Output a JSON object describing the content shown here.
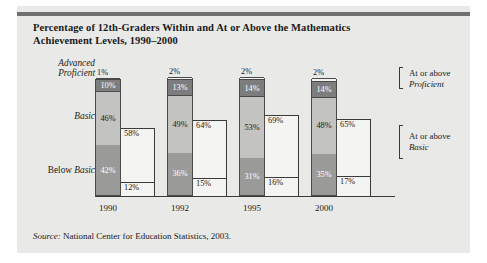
{
  "card": {
    "title_line1": "Percentage of 12th-Graders Within and At or Above the Mathematics",
    "title_line2": "Achievement Levels, 1990–2000",
    "source_prefix": "Source:",
    "source_text": " National Center for Education Statistics, 2003."
  },
  "axis_labels": {
    "left": [
      {
        "line1": "Advanced",
        "line2": "Proficient"
      },
      {
        "line1": "Basic"
      },
      {
        "line1": "Below ",
        "line2": "Basic"
      }
    ],
    "right": [
      {
        "line1": "At or above",
        "line2": "Proficient"
      },
      {
        "line1": "At or above",
        "line2": "Basic"
      }
    ]
  },
  "colors": {
    "card_bg": "#e9e9e7",
    "top_rule": "#6f6f6f",
    "advanced": "#f2f2f0",
    "proficient": "#7d7d7d",
    "basic": "#c3c3c1",
    "below_basic": "#9a9a98",
    "shadow": "#f4f4f2",
    "outline": "#4a4a4a"
  },
  "chart_data": {
    "type": "bar",
    "subtype": "stacked",
    "title": "Percentage of 12th-Graders Within and At or Above the Mathematics Achievement Levels, 1990–2000",
    "xlabel": "",
    "ylabel": "",
    "ylim": [
      0,
      100
    ],
    "grid": false,
    "legend": "none",
    "categories": [
      "1990",
      "1992",
      "1995",
      "2000"
    ],
    "series": [
      {
        "name": "Advanced",
        "values": [
          1,
          2,
          2,
          2
        ],
        "labels": [
          "1%",
          "2%",
          "2%",
          "2%"
        ]
      },
      {
        "name": "Proficient",
        "values": [
          10,
          13,
          14,
          14
        ],
        "labels": [
          "10%",
          "13%",
          "14%",
          "14%"
        ]
      },
      {
        "name": "Basic",
        "values": [
          46,
          49,
          53,
          48
        ],
        "labels": [
          "46%",
          "49%",
          "53%",
          "48%"
        ]
      },
      {
        "name": "Below Basic",
        "values": [
          42,
          36,
          31,
          35
        ],
        "labels": [
          "42%",
          "36%",
          "31%",
          "35%"
        ]
      }
    ],
    "cumulative": [
      {
        "name": "At or above Proficient",
        "values": [
          12,
          15,
          16,
          17
        ],
        "labels": [
          "12%",
          "15%",
          "16%",
          "17%"
        ]
      },
      {
        "name": "At or above Basic",
        "values": [
          58,
          64,
          69,
          65
        ],
        "labels": [
          "58%",
          "64%",
          "69%",
          "65%"
        ]
      }
    ]
  }
}
